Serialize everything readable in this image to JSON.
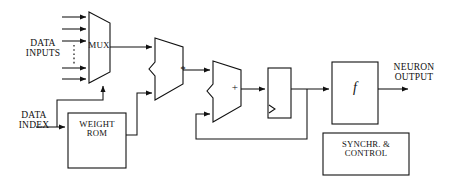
{
  "diagram": {
    "colors": {
      "line": "#111111",
      "text": "#111111",
      "background": "#ffffff"
    },
    "labels": {
      "data_inputs": "DATA\nINPUTS",
      "data_index": "DATA\nINDEX",
      "mux": "MUX",
      "weight_rom": "WEIGHT\nROM",
      "multiplier": "*",
      "adder": "+",
      "activation": "f",
      "neuron_output": "NEURON\nOUTPUT",
      "synchr_control": "SYNCHR. &\nCONTROL"
    },
    "blocks": [
      {
        "id": "mux",
        "label": "MUX",
        "shape": "trapezoid",
        "inputs": 5,
        "select_input": "bottom"
      },
      {
        "id": "weight-rom",
        "label": "WEIGHT ROM",
        "shape": "rectangle"
      },
      {
        "id": "multiplier",
        "label": "*",
        "shape": "alu"
      },
      {
        "id": "adder",
        "label": "+",
        "shape": "alu"
      },
      {
        "id": "register",
        "label": "",
        "shape": "rectangle-clocked",
        "clock_marker": "triangle"
      },
      {
        "id": "activation",
        "label": "f",
        "shape": "rectangle"
      },
      {
        "id": "synchr-control",
        "label": "SYNCHR. & CONTROL",
        "shape": "rectangle"
      }
    ],
    "signals": [
      {
        "from": "data-inputs",
        "to": "mux",
        "style": "solid",
        "count": 5
      },
      {
        "from": "data-inputs",
        "to": "mux",
        "style": "dotted",
        "count": 1
      },
      {
        "from": "data-index",
        "to": "weight-rom",
        "style": "solid"
      },
      {
        "from": "data-index",
        "to": "mux-select",
        "style": "solid"
      },
      {
        "from": "mux",
        "to": "multiplier",
        "style": "solid"
      },
      {
        "from": "weight-rom",
        "to": "multiplier",
        "style": "solid"
      },
      {
        "from": "multiplier",
        "to": "adder",
        "style": "solid"
      },
      {
        "from": "adder",
        "to": "register",
        "style": "solid"
      },
      {
        "from": "register",
        "to": "activation",
        "style": "solid"
      },
      {
        "from": "register",
        "to": "adder",
        "style": "solid",
        "note": "accumulator-feedback"
      },
      {
        "from": "activation",
        "to": "neuron-output",
        "style": "solid"
      }
    ]
  }
}
